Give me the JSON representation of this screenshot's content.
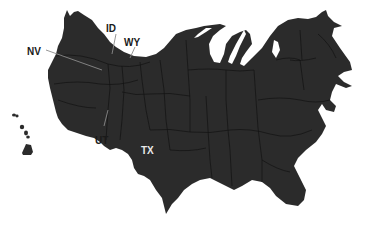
{
  "map": {
    "type": "cartogram",
    "region": "United States",
    "fill_color": "#2b2b2b",
    "border_color": "#0e0e0e",
    "background": "#ffffff",
    "labels": [
      {
        "id": "NV",
        "text": "NV",
        "color": "#1a1a1a"
      },
      {
        "id": "ID",
        "text": "ID",
        "color": "#1a1a1a"
      },
      {
        "id": "WY",
        "text": "WY",
        "color": "#1a1a1a"
      },
      {
        "id": "UT",
        "text": "UT",
        "color": "#1a1a1a"
      },
      {
        "id": "TX",
        "text": "TX",
        "color": "#e8e8e8"
      }
    ]
  }
}
